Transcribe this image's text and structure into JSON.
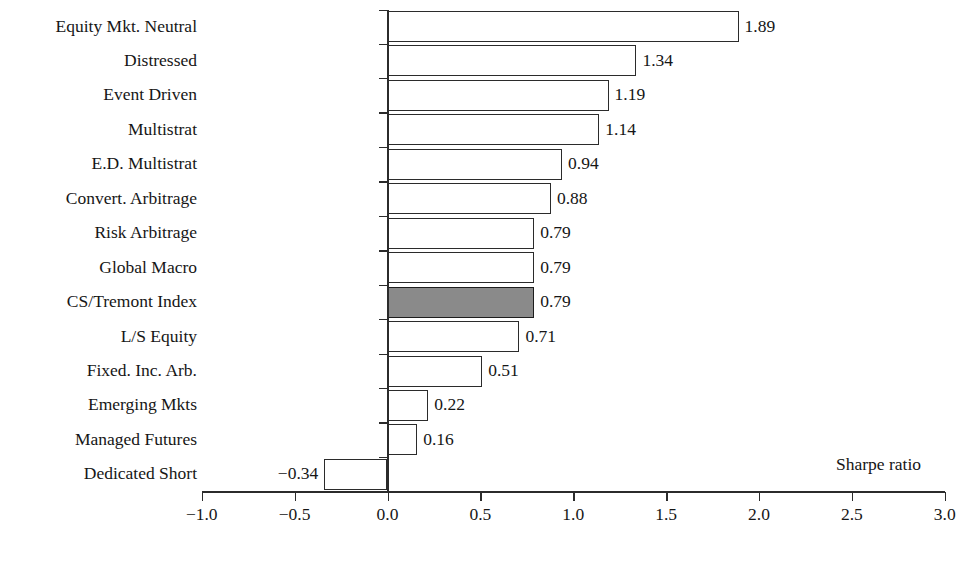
{
  "chart_data": {
    "type": "bar",
    "orientation": "horizontal",
    "title": "",
    "xlabel": "Sharpe ratio",
    "ylabel": "",
    "xlim": [
      -1.0,
      3.0
    ],
    "grid": false,
    "legend": null,
    "categories": [
      "Equity Mkt. Neutral",
      "Distressed",
      "Event Driven",
      "Multistrat",
      "E.D. Multistrat",
      "Convert. Arbitrage",
      "Risk Arbitrage",
      "Global Macro",
      "CS/Tremont Index",
      "L/S Equity",
      "Fixed. Inc. Arb.",
      "Emerging Mkts",
      "Managed Futures",
      "Dedicated Short"
    ],
    "values": [
      1.89,
      1.34,
      1.19,
      1.14,
      0.94,
      0.88,
      0.79,
      0.79,
      0.79,
      0.71,
      0.51,
      0.22,
      0.16,
      -0.34
    ],
    "value_labels": [
      "1.89",
      "1.34",
      "1.19",
      "1.14",
      "0.94",
      "0.88",
      "0.79",
      "0.79",
      "0.79",
      "0.71",
      "0.51",
      "0.22",
      "0.16",
      "−0.34"
    ],
    "highlighted_category": "CS/Tremont Index",
    "xticks": [
      -1.0,
      -0.5,
      0.0,
      0.5,
      1.0,
      1.5,
      2.0,
      2.5,
      3.0
    ],
    "xtick_labels": [
      "−1.0",
      "−0.5",
      "0.0",
      "0.5",
      "1.0",
      "1.5",
      "2.0",
      "2.5",
      "3.0"
    ],
    "colors": {
      "bar_fill": "#ffffff",
      "bar_highlight_fill": "#8a8a8a",
      "bar_border": "#2b2b2b",
      "axis": "#2b2b2b",
      "text": "#161616",
      "background": "#ffffff"
    }
  }
}
